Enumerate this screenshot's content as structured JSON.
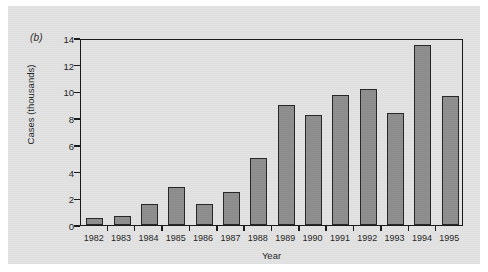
{
  "figure": {
    "panel_letter": "(b)"
  },
  "chart_data": {
    "type": "bar",
    "title": "",
    "xlabel": "Year",
    "ylabel": "Cases (thousands)",
    "categories": [
      "1982",
      "1983",
      "1984",
      "1985",
      "1986",
      "1987",
      "1988",
      "1989",
      "1990",
      "1991",
      "1992",
      "1993",
      "1994",
      "1995"
    ],
    "values": [
      0.55,
      0.7,
      1.55,
      2.85,
      1.55,
      2.5,
      5.05,
      9.0,
      8.2,
      9.7,
      10.2,
      8.4,
      13.5,
      9.65
    ],
    "ylim": [
      0,
      14
    ],
    "yticks": [
      0,
      2,
      4,
      6,
      8,
      10,
      12,
      14
    ],
    "ytick_labels": [
      "0",
      "2",
      "4",
      "6",
      "8",
      "10",
      "12",
      "14"
    ],
    "grid": false,
    "legend": null,
    "series_name": "Cases",
    "bar_color": "#8e8e8e",
    "bar_edge_color": "#262626",
    "plot_background": "#e2e2e2",
    "axis_color": "#1a1a1a"
  }
}
